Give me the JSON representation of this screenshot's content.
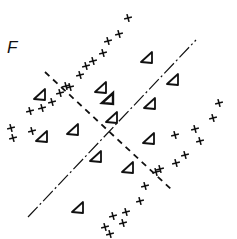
{
  "panel": {
    "label": "F"
  },
  "colors": {
    "ink": "#111111",
    "background": "#ffffff"
  },
  "lines": {
    "solid_dashdot": {
      "style": "dash-dot",
      "x1": 28,
      "y1": 217,
      "x2": 196,
      "y2": 40
    },
    "dashed": {
      "style": "dashed",
      "x1": 45,
      "y1": 72,
      "x2": 172,
      "y2": 190
    }
  },
  "plus_points": [
    [
      128,
      18
    ],
    [
      119,
      34
    ],
    [
      108,
      41
    ],
    [
      103,
      53
    ],
    [
      93,
      61
    ],
    [
      86,
      66
    ],
    [
      80,
      75
    ],
    [
      70,
      87
    ],
    [
      66,
      86
    ],
    [
      60,
      93
    ],
    [
      52,
      102
    ],
    [
      42,
      108
    ],
    [
      30,
      111
    ],
    [
      11,
      128
    ],
    [
      13,
      138
    ],
    [
      32,
      131
    ],
    [
      219,
      103
    ],
    [
      213,
      118
    ],
    [
      195,
      129
    ],
    [
      175,
      135
    ],
    [
      200,
      141
    ],
    [
      185,
      155
    ],
    [
      176,
      163
    ],
    [
      156,
      172
    ],
    [
      160,
      169
    ],
    [
      145,
      186
    ],
    [
      140,
      201
    ],
    [
      126,
      212
    ],
    [
      113,
      216
    ],
    [
      123,
      223
    ],
    [
      105,
      227
    ],
    [
      110,
      234
    ]
  ],
  "triangle_points": [
    [
      101,
      88
    ],
    [
      147,
      58
    ],
    [
      173,
      80
    ],
    [
      150,
      104
    ],
    [
      112,
      118
    ],
    [
      73,
      130
    ],
    [
      42,
      137
    ],
    [
      149,
      139
    ],
    [
      96,
      157
    ],
    [
      128,
      168
    ],
    [
      78,
      208
    ],
    [
      40,
      95
    ]
  ],
  "center_marker": {
    "x": 108,
    "y": 99
  }
}
